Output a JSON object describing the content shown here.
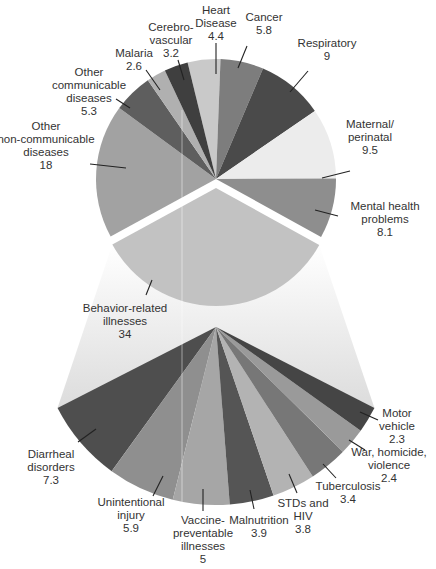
{
  "chart_data": {
    "type": "pie",
    "title": "",
    "unit": "percent",
    "main_pie": {
      "categories": [
        "Heart Disease",
        "Cancer",
        "Respiratory",
        "Maternal/perinatal",
        "Mental health problems",
        "Behavior-related illnesses",
        "Other non-communicable diseases",
        "Other communicable diseases",
        "Malaria",
        "Cerebrovascular"
      ],
      "values": [
        4.4,
        5.8,
        9,
        9.5,
        8.1,
        34,
        18,
        5.3,
        2.6,
        3.2
      ],
      "exploded": "Behavior-related illnesses"
    },
    "breakdown": {
      "parent": "Behavior-related illnesses",
      "parent_value": 34,
      "categories": [
        "Diarrheal disorders",
        "Unintentional injury",
        "Vaccine-preventable illnesses",
        "Malnutrition",
        "STDs and HIV",
        "Tuberculosis",
        "War, homicide, violence",
        "Motor vehicle"
      ],
      "values": [
        7.3,
        5.9,
        5,
        3.9,
        3.8,
        3.4,
        2.4,
        2.3
      ]
    },
    "legend": "none",
    "grid": false
  },
  "labels": {
    "heart": [
      "Heart",
      "Disease",
      "4.4"
    ],
    "cancer": [
      "Cancer",
      "5.8"
    ],
    "resp": [
      "Respiratory",
      "9"
    ],
    "maternal": [
      "Maternal/",
      "perinatal",
      "9.5"
    ],
    "mental": [
      "Mental health",
      "problems",
      "8.1"
    ],
    "behavior": [
      "Behavior-related",
      "illnesses",
      "34"
    ],
    "noncomm": [
      "Other",
      "non-communicable",
      "diseases",
      "18"
    ],
    "comm": [
      "Other",
      "communicable",
      "diseases",
      "5.3"
    ],
    "malaria": [
      "Malaria",
      "2.6"
    ],
    "cerebro": [
      "Cerebro-",
      "vascular",
      "3.2"
    ],
    "diarrheal": [
      "Diarrheal",
      "disorders",
      "7.3"
    ],
    "injury": [
      "Unintentional",
      "injury",
      "5.9"
    ],
    "vaccine": [
      "Vaccine-",
      "preventable",
      "illnesses",
      "5"
    ],
    "malnut": [
      "Malnutrition",
      "3.9"
    ],
    "std": [
      "STDs and",
      "HIV",
      "3.8"
    ],
    "tb": [
      "Tuberculosis",
      "3.4"
    ],
    "war": [
      "War, homicide,",
      "violence",
      "2.4"
    ],
    "motor": [
      "Motor",
      "vehicle",
      "2.3"
    ]
  },
  "colors": {
    "heart": "#c9c9c9",
    "cancer": "#7d7d7d",
    "resp": "#4a4a4a",
    "maternal": "#ececec",
    "mental": "#8e8e8e",
    "behavior": "#c2c2c2",
    "noncomm": "#a2a2a2",
    "comm": "#5e5e5e",
    "malaria": "#b0b0b0",
    "cerebro": "#3f3f3f",
    "diarrheal": "#4e4e4e",
    "injury": "#8f8f8f",
    "vaccine": "#a6a6a6",
    "malnut": "#555555",
    "std": "#b3b3b3",
    "tb": "#777777",
    "war": "#9a9a9a",
    "motor": "#454545",
    "leader": "#222222",
    "text": "#333333"
  }
}
